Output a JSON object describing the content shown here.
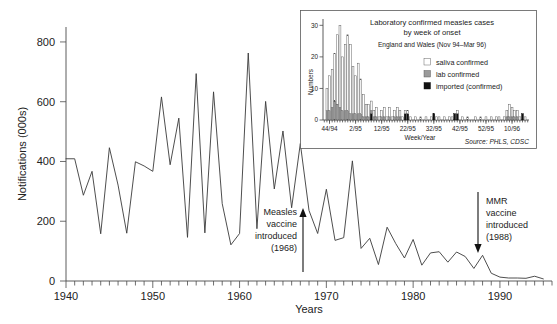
{
  "chart_data": [
    {
      "id": "main",
      "type": "line",
      "title": "",
      "xlabel": "Years",
      "ylabel": "Notifications (000s)",
      "xlim": [
        1940,
        1996
      ],
      "ylim": [
        0,
        850
      ],
      "yticks": [
        0,
        200,
        400,
        600,
        800
      ],
      "xticks": [
        1940,
        1950,
        1960,
        1970,
        1980,
        1990
      ],
      "xtick_labels": [
        "1940",
        "1950",
        "1960",
        "1970",
        "1980",
        "1990"
      ],
      "ytick_labels": [
        "0",
        "200",
        "400",
        "600",
        "800"
      ],
      "minor_tick_interval": 1,
      "grid": false,
      "legend": "none",
      "series_name": "Measles notifications",
      "x": [
        1940,
        1941,
        1942,
        1943,
        1944,
        1945,
        1946,
        1947,
        1948,
        1949,
        1950,
        1951,
        1952,
        1953,
        1954,
        1955,
        1956,
        1957,
        1958,
        1959,
        1960,
        1961,
        1962,
        1963,
        1964,
        1965,
        1966,
        1967,
        1968,
        1969,
        1970,
        1971,
        1972,
        1973,
        1974,
        1975,
        1976,
        1977,
        1978,
        1979,
        1980,
        1981,
        1982,
        1983,
        1984,
        1985,
        1986,
        1987,
        1988,
        1989,
        1990,
        1991,
        1992,
        1993,
        1994,
        1995
      ],
      "values": [
        409,
        409,
        287,
        367,
        158,
        446,
        321,
        160,
        399,
        385,
        367,
        616,
        389,
        545,
        146,
        694,
        161,
        633,
        259,
        121,
        159,
        763,
        175,
        601,
        308,
        502,
        245,
        460,
        236,
        159,
        307,
        136,
        145,
        402,
        109,
        143,
        55,
        180,
        125,
        77,
        139,
        53,
        94,
        98,
        63,
        97,
        82,
        42,
        86,
        26,
        13,
        10,
        10,
        9,
        16,
        7
      ],
      "annotations": [
        {
          "text_lines": [
            "Measles",
            "vaccine",
            "introduced",
            "(1968)"
          ],
          "year": 1968,
          "arrow": "up"
        },
        {
          "text_lines": [
            "MMR",
            "vaccine",
            "introduced",
            "(1988)"
          ],
          "year": 1988,
          "arrow": "down"
        }
      ]
    },
    {
      "id": "inset",
      "type": "bar",
      "title": "Laboratory confirmed measles cases",
      "title2": "by week of onset",
      "subtitle": "England and Wales (Nov 94–Mar 96)",
      "xlabel": "Week/Year",
      "ylabel": "Numbers",
      "source": "Source: PHLS, CDSC",
      "ylim": [
        0,
        32
      ],
      "yticks": [
        0,
        10,
        20,
        30
      ],
      "ytick_labels": [
        "0",
        "10",
        "20",
        "30"
      ],
      "xtick_labels": [
        "44/94",
        "2/95",
        "12/95",
        "22/95",
        "32/95",
        "42/95",
        "52/95",
        "10/96"
      ],
      "xtick_positions": [
        2,
        12,
        22,
        32,
        42,
        52,
        62,
        72
      ],
      "grid": false,
      "legend_position": "upper-right",
      "legend": [
        {
          "label": "saliva confirmed",
          "swatch": "white"
        },
        {
          "label": "lab confirmed",
          "swatch": "grey"
        },
        {
          "label": "imported (confirmed)",
          "swatch": "black"
        }
      ],
      "series": [
        {
          "name": "saliva confirmed",
          "values": [
            0,
            7,
            11,
            12,
            15,
            22,
            26,
            17,
            21,
            24,
            22,
            15,
            12,
            16,
            11,
            7,
            4,
            4,
            3,
            2,
            3,
            1,
            2,
            3,
            1,
            3,
            1,
            2,
            3,
            2,
            1,
            1,
            1,
            1,
            0,
            1,
            0,
            1,
            0,
            1,
            0,
            1,
            0,
            1,
            1,
            0,
            1,
            0,
            1,
            1,
            0,
            1,
            0,
            1,
            0,
            1,
            0,
            0,
            1,
            0,
            1,
            0,
            1,
            0,
            1,
            0,
            1,
            1,
            0,
            1,
            2,
            4,
            3,
            2,
            2,
            1,
            0,
            1,
            0
          ]
        },
        {
          "name": "lab confirmed",
          "values": [
            0,
            3,
            3,
            4,
            6,
            5,
            4,
            3,
            3,
            3,
            2,
            2,
            2,
            2,
            2,
            1,
            1,
            1,
            1,
            1,
            1,
            0,
            1,
            1,
            0,
            1,
            0,
            1,
            1,
            1,
            0,
            0,
            0,
            0,
            0,
            0,
            0,
            0,
            0,
            0,
            0,
            0,
            0,
            0,
            0,
            0,
            0,
            0,
            0,
            0,
            0,
            0,
            0,
            0,
            0,
            0,
            0,
            0,
            0,
            0,
            0,
            0,
            0,
            0,
            0,
            0,
            0,
            0,
            0,
            0,
            1,
            1,
            1,
            1,
            1,
            0,
            0,
            0,
            0
          ]
        },
        {
          "name": "imported (confirmed)",
          "values": [
            0,
            0,
            0,
            0,
            0,
            0,
            0,
            0,
            0,
            0,
            0,
            0,
            0,
            0,
            0,
            0,
            0,
            0,
            2,
            0,
            0,
            0,
            0,
            0,
            0,
            0,
            0,
            0,
            0,
            0,
            0,
            2,
            2,
            0,
            0,
            0,
            0,
            0,
            0,
            0,
            0,
            0,
            2,
            0,
            0,
            0,
            0,
            0,
            0,
            0,
            2,
            2,
            0,
            0,
            0,
            0,
            0,
            0,
            0,
            0,
            0,
            0,
            0,
            0,
            0,
            0,
            0,
            0,
            0,
            0,
            0,
            0,
            0,
            0,
            0,
            0,
            2,
            0,
            0
          ]
        }
      ]
    }
  ],
  "main": {
    "ylabel": "Notifications (000s)",
    "xlabel": "Years",
    "ytick_labels": [
      "800",
      "600",
      "400",
      "200",
      "0"
    ],
    "xtick_labels": [
      "1940",
      "1950",
      "1960",
      "1970",
      "1980",
      "1990"
    ],
    "annotation_left": {
      "line1": "Measles",
      "line2": "vaccine",
      "line3": "introduced",
      "line4": "(1968)"
    },
    "annotation_right": {
      "line1": "MMR",
      "line2": "vaccine",
      "line3": "introduced",
      "line4": "(1988)"
    }
  },
  "inset": {
    "title_line1": "Laboratory confirmed measles cases",
    "title_line2": "by week of onset",
    "subtitle": "England and Wales (Nov 94–Mar 96)",
    "ylabel": "Numbers",
    "xlabel": "Week/Year",
    "ytick_labels": [
      "30",
      "20",
      "10",
      "0"
    ],
    "xtick_labels": [
      "44/94",
      "2/95",
      "12/95",
      "22/95",
      "32/95",
      "42/95",
      "52/95",
      "10/96"
    ],
    "legend_saliva": "saliva confirmed",
    "legend_lab": "lab confirmed",
    "legend_imported": "imported (confirmed)",
    "source": "Source: PHLS, CDSC"
  },
  "colors": {
    "line": "#3a3a3a",
    "axis": "#4a4a4a",
    "text": "#1a1a1a",
    "bar_lab": "#9a9a9a",
    "bar_imported": "#111111",
    "background": "#ffffff"
  }
}
